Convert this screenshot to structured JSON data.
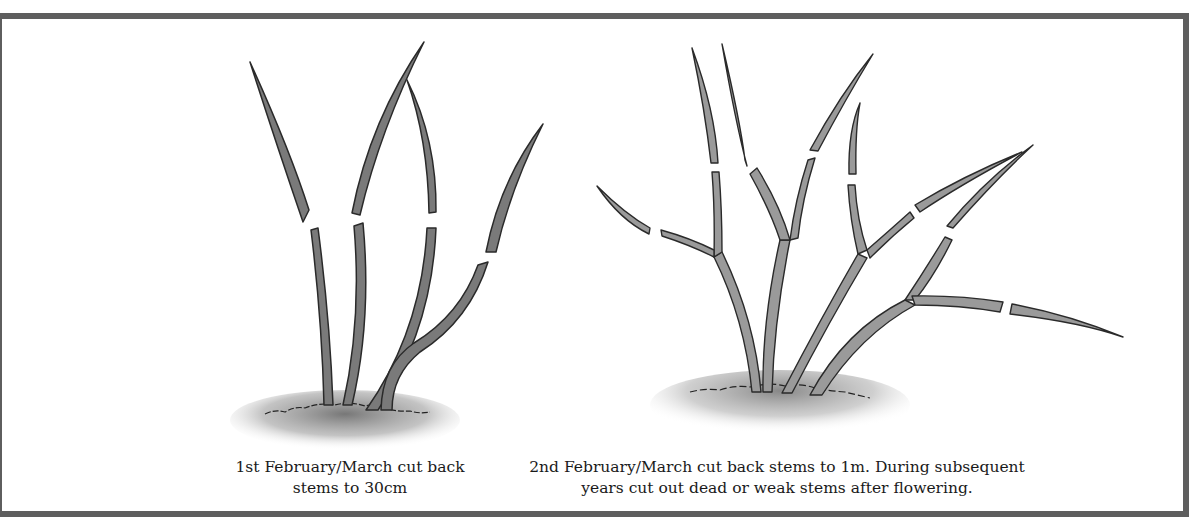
{
  "diagram": {
    "type": "pruning-illustration",
    "panels": [
      {
        "id": "year-1",
        "caption_line1": "1st February/March cut back",
        "caption_line2": "stems to 30cm",
        "stem_count": 4,
        "stem_color": "#7a7a7a"
      },
      {
        "id": "year-2",
        "caption_line1": "2nd February/March cut back stems to 1m. During subsequent",
        "caption_line2": "years cut out dead or weak stems after flowering.",
        "stem_count": 4,
        "stem_color": "#9a9a9a"
      }
    ],
    "colors": {
      "frame": "#5e5e5e",
      "outline": "#2a2a2a",
      "soil": "#8a8a8a",
      "background": "#ffffff"
    }
  }
}
